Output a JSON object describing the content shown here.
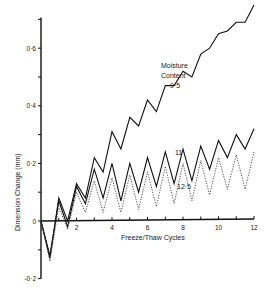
{
  "chart_data": {
    "type": "line",
    "title": "",
    "xlabel": "Freeze/Thaw Cycles",
    "ylabel": "Dimension Change (mm)",
    "xlim": [
      0,
      12
    ],
    "ylim": [
      -0.2,
      0.7
    ],
    "x_ticks": [
      2,
      4,
      6,
      8,
      10,
      12
    ],
    "y_ticks": [
      -0.2,
      0,
      0.2,
      0.4,
      0.6
    ],
    "y_tick_labels": [
      "-0·2",
      "0",
      "0·2",
      "0·4",
      "0·6"
    ],
    "grid": false,
    "legend": "inline annotations",
    "annotations": [
      "Moisture",
      "Content",
      "9·5",
      "11",
      "12·5"
    ],
    "series": [
      {
        "name": "9.5",
        "style": "solid",
        "x": [
          0,
          0.5,
          1,
          1.5,
          2,
          2.5,
          3,
          3.5,
          4,
          4.5,
          5,
          5.5,
          6,
          6.5,
          7,
          7.5,
          8,
          8.5,
          9,
          9.5,
          10,
          10.5,
          11,
          11.5,
          12
        ],
        "values": [
          0,
          -0.13,
          0.08,
          0.0,
          0.13,
          0.08,
          0.22,
          0.17,
          0.31,
          0.25,
          0.36,
          0.33,
          0.42,
          0.38,
          0.47,
          0.47,
          0.52,
          0.5,
          0.58,
          0.6,
          0.65,
          0.66,
          0.69,
          0.69,
          0.75
        ]
      },
      {
        "name": "11",
        "style": "solid",
        "x": [
          0,
          0.5,
          1,
          1.5,
          2,
          2.5,
          3,
          3.5,
          4,
          4.5,
          5,
          5.5,
          6,
          6.5,
          7,
          7.5,
          8,
          8.5,
          9,
          9.5,
          10,
          10.5,
          11,
          11.5,
          12
        ],
        "values": [
          0,
          -0.12,
          0.07,
          -0.02,
          0.12,
          0.06,
          0.18,
          0.08,
          0.2,
          0.07,
          0.2,
          0.1,
          0.22,
          0.12,
          0.24,
          0.13,
          0.25,
          0.14,
          0.26,
          0.18,
          0.28,
          0.22,
          0.3,
          0.25,
          0.32
        ]
      },
      {
        "name": "12.5",
        "style": "dotted",
        "x": [
          0,
          0.5,
          1,
          1.5,
          2,
          2.5,
          3,
          3.5,
          4,
          4.5,
          5,
          5.5,
          6,
          6.5,
          7,
          7.5,
          8,
          8.5,
          9,
          9.5,
          10,
          10.5,
          11,
          11.5,
          12
        ],
        "values": [
          0,
          -0.14,
          0.05,
          -0.03,
          0.1,
          0.03,
          0.14,
          0.03,
          0.15,
          0.03,
          0.16,
          0.04,
          0.17,
          0.05,
          0.19,
          0.06,
          0.2,
          0.07,
          0.21,
          0.09,
          0.22,
          0.11,
          0.23,
          0.11,
          0.24
        ]
      }
    ]
  },
  "labels": {
    "annotation_line1": "Moisture",
    "annotation_line2": "Content",
    "label_95": "9·5",
    "label_11": "11",
    "label_125": "12·5"
  }
}
